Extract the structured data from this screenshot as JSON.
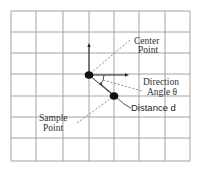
{
  "diagram": {
    "grid": {
      "cols": 7,
      "rows": 7,
      "x_lines": [
        11,
        36,
        63,
        89,
        114,
        139,
        165,
        190
      ],
      "y_lines": [
        11,
        32,
        53,
        74,
        96,
        117,
        138,
        161
      ],
      "color": "#9a9a9a"
    },
    "labels": {
      "center_point_line1": "Center",
      "center_point_line2": "Point",
      "direction_angle_line1": "Direction",
      "direction_angle_line2": "Angle θ",
      "distance": "Distance d",
      "sample_point_line1": "Sample",
      "sample_point_line2": "Point"
    },
    "points": {
      "center": {
        "x": 89,
        "y": 75
      },
      "sample": {
        "x": 114,
        "y": 96
      }
    },
    "colors": {
      "ink": "#111111",
      "dashed": "#888888"
    }
  }
}
